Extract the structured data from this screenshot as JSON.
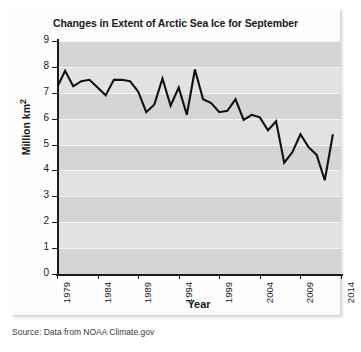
{
  "card": {
    "title": "Changes in Extent of Arctic Sea Ice for September",
    "source": "Source: Data from NOAA Climate.gov"
  },
  "chart_data": {
    "type": "line",
    "title": "Changes in Extent of Arctic Sea Ice for September",
    "xlabel": "Year",
    "ylabel": "Million km2",
    "ylabel_display": "Million km",
    "ylabel_exponent": "2",
    "xlim": [
      1979,
      2014
    ],
    "ylim": [
      0,
      9
    ],
    "ytick_labels": [
      "0",
      "1",
      "2",
      "3",
      "4",
      "5",
      "6",
      "7",
      "8",
      "9"
    ],
    "ytick_values": [
      0,
      1,
      2,
      3,
      4,
      5,
      6,
      7,
      8,
      9
    ],
    "xtick_labels": [
      "1979",
      "1984",
      "1989",
      "1994",
      "1999",
      "2004",
      "2009",
      "2014"
    ],
    "xtick_values": [
      1979,
      1984,
      1989,
      1994,
      1999,
      2004,
      2009,
      2014
    ],
    "grid": "horizontal-white-gridlines",
    "legend": "none",
    "line_color": "#111111",
    "plot_background": "#e2e2e2",
    "x": [
      1979,
      1980,
      1981,
      1982,
      1983,
      1984,
      1985,
      1986,
      1987,
      1988,
      1989,
      1990,
      1991,
      1992,
      1993,
      1994,
      1995,
      1996,
      1997,
      1998,
      1999,
      2000,
      2001,
      2002,
      2003,
      2004,
      2005,
      2006,
      2007,
      2008,
      2009,
      2010,
      2011,
      2012,
      2013
    ],
    "values": [
      7.2,
      7.85,
      7.25,
      7.45,
      7.5,
      7.2,
      6.9,
      7.5,
      7.5,
      7.45,
      7.05,
      6.25,
      6.55,
      7.55,
      6.5,
      7.2,
      6.15,
      7.9,
      6.75,
      6.6,
      6.25,
      6.3,
      6.75,
      5.95,
      6.15,
      6.05,
      5.55,
      5.9,
      4.3,
      4.7,
      5.4,
      4.9,
      4.6,
      3.62,
      5.4
    ],
    "annotations": []
  }
}
